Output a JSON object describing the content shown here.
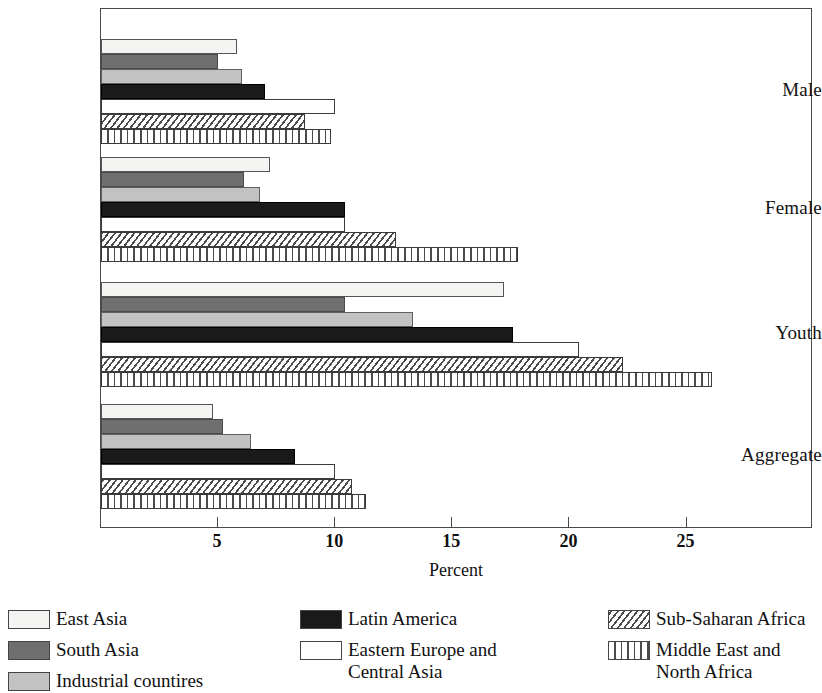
{
  "chart_data": {
    "type": "bar",
    "orientation": "horizontal",
    "title": "",
    "xlabel": "Percent",
    "ylabel": "",
    "xlim": [
      0,
      30.4
    ],
    "xticks": [
      5,
      10,
      15,
      20,
      25
    ],
    "xtick_labels": [
      "5",
      "10",
      "15",
      "20",
      "25"
    ],
    "grid": false,
    "legend_position": "bottom",
    "categories": [
      "Male",
      "Female",
      "Youth",
      "Aggregate"
    ],
    "series": [
      {
        "name": "East Asia",
        "pattern": "light-gray-solid",
        "values": [
          5.8,
          7.2,
          17.2,
          4.8
        ]
      },
      {
        "name": "South Asia",
        "pattern": "dark-gray-solid",
        "values": [
          5.0,
          6.1,
          10.4,
          5.2
        ]
      },
      {
        "name": "Industrial countires",
        "pattern": "medium-gray-solid",
        "values": [
          6.0,
          6.8,
          13.3,
          6.4
        ]
      },
      {
        "name": "Latin America",
        "pattern": "black-solid",
        "values": [
          7.0,
          10.4,
          17.6,
          8.3
        ]
      },
      {
        "name": "Eastern Europe and\nCentral Asia",
        "pattern": "white-outline",
        "values": [
          10.0,
          10.4,
          20.4,
          10.0
        ]
      },
      {
        "name": "Sub-Saharan Africa",
        "pattern": "diagonal-hatch",
        "values": [
          8.7,
          12.6,
          22.3,
          10.7
        ]
      },
      {
        "name": "Middle East and\nNorth Africa",
        "pattern": "vertical-hatch",
        "values": [
          9.8,
          17.8,
          26.1,
          11.3
        ]
      }
    ]
  },
  "axis": {
    "x_title": "Percent",
    "ticks": [
      "5",
      "10",
      "15",
      "20",
      "25"
    ]
  },
  "categories": {
    "male": "Male",
    "female": "Female",
    "youth": "Youth",
    "aggregate": "Aggregate"
  },
  "legend": {
    "col1": [
      {
        "label": "East Asia"
      },
      {
        "label": "South Asia"
      },
      {
        "label": "Industrial countires"
      }
    ],
    "col2": [
      {
        "label": "Latin America"
      },
      {
        "label": "Eastern Europe and\nCentral Asia"
      }
    ],
    "col3": [
      {
        "label": "Sub-Saharan Africa"
      },
      {
        "label": "Middle East and\nNorth Africa"
      }
    ]
  }
}
